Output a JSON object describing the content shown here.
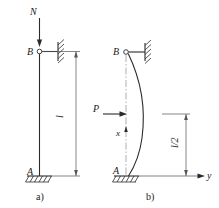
{
  "figure": {
    "title_alt": "Buckling of a column: load case a) and deflected shape b)",
    "background_color": "#ffffff",
    "line_color": "#2b2b2b",
    "panels": [
      {
        "id": "a",
        "caption": "a)",
        "labels": {
          "axial_load": "N",
          "top_support": "B",
          "base_support": "A",
          "length_dimension": "l"
        },
        "supports": {
          "top": "pin-with-horizontal-link-to-hatched-wall",
          "bottom": "fixed-hatched-base"
        }
      },
      {
        "id": "b",
        "caption": "b)",
        "labels": {
          "lateral_load": "P",
          "top_support": "B",
          "base_support": "A",
          "axis_vertical": "x",
          "axis_horizontal": "y",
          "half_length_dimension": "l/2"
        },
        "supports": {
          "top": "pin-with-horizontal-link-to-hatched-wall",
          "bottom": "fixed-hatched-base"
        }
      }
    ]
  }
}
